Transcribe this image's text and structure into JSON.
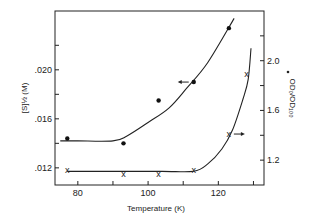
{
  "chart_data": {
    "type": "scatter",
    "title": "",
    "xlabel": "Temperature (K)",
    "ylabel_left": "[S]½ (M)",
    "ylabel_right": "OD₀/OD₁₀₀",
    "xlim": [
      73.5,
      133
    ],
    "ylim_left": [
      0.0106,
      0.0248
    ],
    "ylim_right": [
      1.0,
      2.4
    ],
    "x_ticks": [
      80,
      90,
      100,
      110,
      120,
      130
    ],
    "x_tick_labels": [
      "80",
      "",
      "100",
      "",
      "120",
      ""
    ],
    "y_left_ticks": [
      0.012,
      0.014,
      0.016,
      0.018,
      0.02,
      0.022
    ],
    "y_left_tick_labels": [
      ".012",
      "",
      ".016",
      "",
      ".020",
      ""
    ],
    "y_right_ticks": [
      1.2,
      1.4,
      1.6,
      1.8,
      2.0,
      2.2
    ],
    "y_right_tick_labels": [
      "1.2",
      "",
      "1.6",
      "",
      "2.0",
      ""
    ],
    "grid": false,
    "legend": "none (arrows indicate axis for each series)",
    "series": [
      {
        "name": "[S]½",
        "axis": "left",
        "marker": "filled-circle",
        "x": [
          77,
          93,
          103,
          113,
          123
        ],
        "y": [
          0.0144,
          0.014,
          0.0175,
          0.019,
          0.0234
        ],
        "fit_curve": {
          "x": [
            75,
            80,
            90,
            94,
            100,
            106,
            111,
            117,
            124.5
          ],
          "y": [
            0.0142,
            0.0142,
            0.0142,
            0.0146,
            0.0157,
            0.0169,
            0.0185,
            0.0206,
            0.0242
          ]
        },
        "annotation": "arrow pointing left"
      },
      {
        "name": "OD₀/OD₁₀₀",
        "axis": "right",
        "marker": "x",
        "x": [
          77,
          93,
          103,
          113,
          123,
          128
        ],
        "y": [
          1.12,
          1.09,
          1.09,
          1.12,
          1.41,
          1.89
        ],
        "fit_curve": {
          "x": [
            77,
            90,
            104,
            113,
            117,
            121,
            124,
            127,
            128.5,
            129.3
          ],
          "y": [
            1.11,
            1.11,
            1.11,
            1.11,
            1.17,
            1.29,
            1.44,
            1.69,
            1.85,
            2.1
          ]
        },
        "annotation": "arrow pointing right"
      }
    ]
  }
}
